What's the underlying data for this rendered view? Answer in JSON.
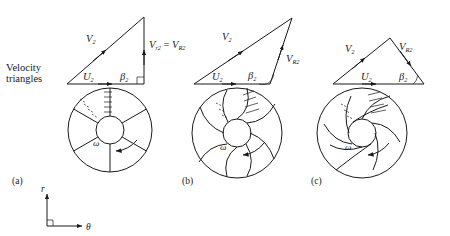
{
  "figure": {
    "caption_left": {
      "line1": "Velocity",
      "line2": "triangles"
    },
    "axes": {
      "radial_label": "r",
      "tangential_label": "θ"
    },
    "panels": [
      {
        "id": "a",
        "label": "(a)",
        "blade_type": "radial",
        "triangle": {
          "u_label": "U",
          "u_sub": "2",
          "v_label": "V",
          "v_sub": "2",
          "vr_label": "V",
          "vr_sub": "r",
          "vr_sub2": "2",
          "vr_eq": "=",
          "vR_label": "V",
          "vR_sub": "R",
          "vR_sub2": "2",
          "beta_label": "β",
          "beta_sub": "2",
          "beta_value_deg": 90,
          "right_angle": true
        },
        "impeller": {
          "omega_label": "ω",
          "blade_count": 6,
          "blade_curvature": 0
        }
      },
      {
        "id": "b",
        "label": "(b)",
        "blade_type": "forward-curved",
        "triangle": {
          "u_label": "U",
          "u_sub": "2",
          "v_label": "V",
          "v_sub": "2",
          "vR_label": "V",
          "vR_sub": "R",
          "vR_sub2": "2",
          "beta_label": "β",
          "beta_sub": "2",
          "beta_value_deg": 115,
          "right_angle": false
        },
        "impeller": {
          "omega_label": "ω",
          "blade_count": 8,
          "blade_curvature": 1
        }
      },
      {
        "id": "c",
        "label": "(c)",
        "blade_type": "backward-curved",
        "triangle": {
          "u_label": "U",
          "u_sub": "2",
          "v_label": "V",
          "v_sub": "2",
          "vR_label": "V",
          "vR_sub": "R",
          "vR_sub2": "2",
          "beta_label": "β",
          "beta_sub": "2",
          "beta_value_deg": 58,
          "right_angle": false
        },
        "impeller": {
          "omega_label": "ω",
          "blade_count": 8,
          "blade_curvature": -1
        }
      }
    ],
    "colors": {
      "ink": "#1a1a1a",
      "background": "#ffffff"
    }
  }
}
